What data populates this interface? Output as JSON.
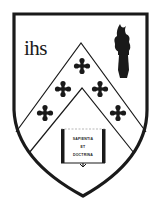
{
  "crest": {
    "monogram": "ihs",
    "book": {
      "line1": "SAPIENTIA",
      "line2": "ET",
      "line3": "DOCTRINA"
    },
    "colors": {
      "ink": "#1a1a1a",
      "field": "#ffffff"
    },
    "charges": [
      "ihs-monogram",
      "torch-icon",
      "chevron",
      "cross-fleury-icon x5",
      "open-book-icon"
    ]
  }
}
